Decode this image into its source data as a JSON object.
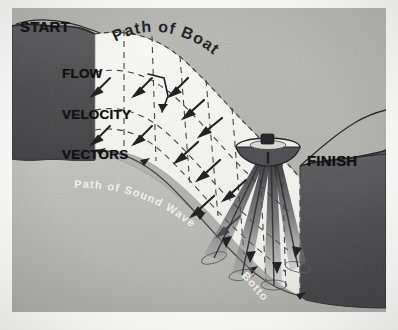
{
  "figure": {
    "canvas": {
      "width": 398,
      "height": 330
    }
  },
  "labels": {
    "start": "START",
    "finish": "FINISH",
    "flow_vectors_line1": "FLOW",
    "flow_vectors_line2": "VELOCITY",
    "flow_vectors_line3": "VECTORS",
    "path_of_boat": "Path  of  Boat",
    "path_of_sound_wave": "Path   of   Sound  Wave",
    "bottom": "Bottom"
  },
  "colors": {
    "paper": "#fdfdfb",
    "bank_dark": "#4a4a4c",
    "bed_gray": "#b9b9b5",
    "sky_gray": "#b3b3b0",
    "curtain_white": "#f7f7f3",
    "ink": "#1a1a1e",
    "white_text": "#f4f4f0",
    "beam_dark": "#303034"
  },
  "scene": {
    "left_bank": "START bank, dark, vertical cut at left",
    "right_bank": "FINISH bank, dark, vertical cut at right",
    "riverbed": "light gray sloping bed between banks",
    "measurement_curtain": "white vertical section swept by the boat",
    "boat": "survey boat with transducer at water surface",
    "acoustic_beams": 4,
    "beam_direction": "downward fan from boat hull toward bed"
  },
  "elements": {
    "boat_name": "survey-boat",
    "beam_name": "acoustic-beam",
    "vector_name": "flow-velocity-vector",
    "grid_name": "dashed-grid-line"
  }
}
